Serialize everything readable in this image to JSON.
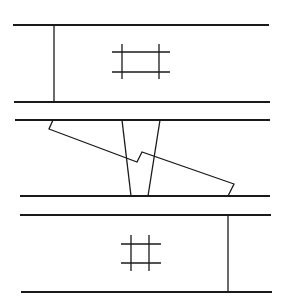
{
  "diagram": {
    "panels": [
      {
        "id": "top",
        "post_side": "left",
        "has_hash": true
      },
      {
        "id": "middle",
        "has_wedge": true,
        "has_stepped_diagonal": true
      },
      {
        "id": "bottom",
        "post_side": "right",
        "has_hash": true
      }
    ],
    "line_color": "#1a1a1a",
    "background": "#ffffff"
  }
}
